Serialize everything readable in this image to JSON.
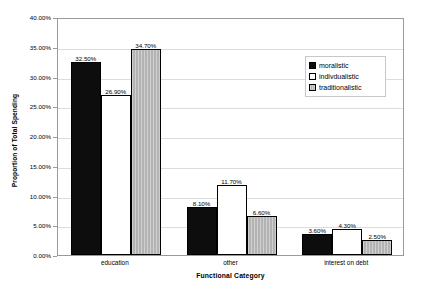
{
  "chart_data": {
    "type": "bar",
    "title": "",
    "xlabel": "Functional Category",
    "ylabel": "Proportion of Total Spending",
    "categories": [
      "education",
      "other",
      "interest on debt"
    ],
    "series": [
      {
        "name": "moralistic",
        "color": "#0d0d0d",
        "values": [
          32.5,
          8.1,
          3.6
        ],
        "labels": [
          "32.50%",
          "8.10%",
          "3.60%"
        ]
      },
      {
        "name": "indivdualistic",
        "color": "#ffffff",
        "values": [
          26.9,
          11.7,
          4.3
        ],
        "labels": [
          "26.90%",
          "11.70%",
          "4.30%"
        ]
      },
      {
        "name": "traditionalistic",
        "color": "#b3b3b3",
        "values": [
          34.7,
          6.6,
          2.5
        ],
        "labels": [
          "34.70%",
          "6.60%",
          "2.50%"
        ]
      }
    ],
    "ylim": [
      0,
      40
    ],
    "ytick_values": [
      0,
      5,
      10,
      15,
      20,
      25,
      30,
      35,
      40
    ],
    "ytick_labels": [
      "0.00%",
      "5.00%",
      "10.00%",
      "15.00%",
      "20.00%",
      "25.00%",
      "30.00%",
      "35.00%",
      "40.00%"
    ],
    "grid": true,
    "legend_position": "upper-right-inside",
    "gridline_color": "#dcdcdc",
    "axis_color": "#9a9a9a"
  },
  "legend": {
    "items": [
      {
        "label": "moralistic"
      },
      {
        "label": "indivdualistic"
      },
      {
        "label": "traditionalistic"
      }
    ]
  }
}
